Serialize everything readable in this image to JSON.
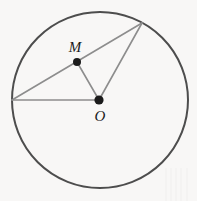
{
  "figure": {
    "canvas": {
      "width": 197,
      "height": 201
    },
    "background_color": "#f8f7f6",
    "stroke_colors": {
      "circle": "#4d4d4d",
      "segment": "#8d8d8d",
      "dot": "#1b1b1b",
      "label": "#1b1b1b"
    },
    "circle": {
      "name": "main-circle",
      "center_x": 100,
      "center_y": 100,
      "radius": 88,
      "stroke_width": 2
    },
    "points": [
      {
        "id": "O",
        "label": "O",
        "x": 99,
        "y": 100,
        "dot_radius": 4.6,
        "label_x": 100,
        "label_y": 121,
        "labeled": true,
        "role": "center"
      },
      {
        "id": "M",
        "label": "M",
        "x": 77,
        "y": 62,
        "dot_radius": 4.0,
        "label_x": 75,
        "label_y": 52,
        "labeled": true,
        "role": "chord-midpoint"
      },
      {
        "id": "A",
        "label": "",
        "x": 12,
        "y": 100,
        "dot_radius": 0,
        "label_x": 0,
        "label_y": 0,
        "labeled": false,
        "role": "circle-point-left"
      },
      {
        "id": "B",
        "label": "",
        "x": 142,
        "y": 23,
        "dot_radius": 0,
        "label_x": 0,
        "label_y": 0,
        "labeled": false,
        "role": "circle-point-upper-right"
      }
    ],
    "segments": [
      {
        "id": "chord-AB",
        "from": "A",
        "to": "B",
        "x1": 12,
        "y1": 100,
        "x2": 142,
        "y2": 23,
        "description": "chord through M"
      },
      {
        "id": "radius-OA",
        "from": "O",
        "to": "A",
        "x1": 99,
        "y1": 100,
        "x2": 12,
        "y2": 100,
        "description": "horizontal radius to left point"
      },
      {
        "id": "radius-OB",
        "from": "O",
        "to": "B",
        "x1": 99,
        "y1": 100,
        "x2": 142,
        "y2": 23,
        "description": "radius to upper-right point"
      },
      {
        "id": "segment-OM",
        "from": "O",
        "to": "M",
        "x1": 99,
        "y1": 100,
        "x2": 77,
        "y2": 62,
        "description": "segment from center to chord midpoint"
      }
    ],
    "stripes": [
      {
        "x": 165,
        "y": 168,
        "width": 2,
        "height": 33
      },
      {
        "x": 170,
        "y": 168,
        "width": 2,
        "height": 33
      },
      {
        "x": 175,
        "y": 168,
        "width": 2,
        "height": 33
      },
      {
        "x": 180,
        "y": 168,
        "width": 2,
        "height": 33
      },
      {
        "x": 186,
        "y": 168,
        "width": 2,
        "height": 33
      }
    ]
  }
}
